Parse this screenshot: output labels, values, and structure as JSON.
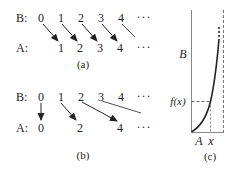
{
  "panel_a": {
    "caption": "(a)",
    "row_b_label": "B:",
    "row_a_label": "A:",
    "b_values": [
      "0",
      "1",
      "2",
      "3",
      "4",
      "···"
    ],
    "a_values": [
      "1",
      "2",
      "3",
      "4",
      "···"
    ],
    "mappings": [
      [
        "0",
        "1"
      ],
      [
        "1",
        "2"
      ],
      [
        "2",
        "3"
      ],
      [
        "3",
        "4"
      ],
      [
        "4",
        "…"
      ]
    ]
  },
  "panel_b": {
    "caption": "(b)",
    "row_b_label": "B:",
    "row_a_label": "A:",
    "b_values": [
      "0",
      "1",
      "2",
      "3",
      "4",
      "···"
    ],
    "a_values": [
      "0",
      "2",
      "4",
      "···"
    ],
    "mappings": [
      [
        "0",
        "0"
      ],
      [
        "1",
        "2"
      ],
      [
        "2",
        "4"
      ],
      [
        "3",
        "…"
      ]
    ]
  },
  "panel_c": {
    "caption": "(c)",
    "y_axis_label": "B",
    "x_axis_label": "A",
    "x_marker": "x",
    "y_marker": "f(x)"
  }
}
